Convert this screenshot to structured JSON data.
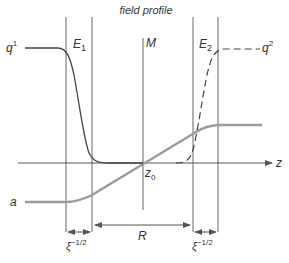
{
  "title": "field profile",
  "labels": {
    "q1": "q",
    "q1_sup": "1",
    "q2": "q",
    "q2_sup": "2",
    "E1": "E",
    "E1_sub": "1",
    "E2": "E",
    "E2_sub": "2",
    "M": "M",
    "z": "z",
    "z0": "z",
    "z0_sub": "0",
    "a": "a",
    "R": "R",
    "xi_left": "ξ",
    "xi_left_sup": "−1/2",
    "xi_right": "ξ",
    "xi_right_sup": "−1/2"
  },
  "colors": {
    "line": "#555555",
    "a_curve": "#9a9a9a",
    "q_curve": "#444444"
  },
  "curves": [
    {
      "name": "q1",
      "style": "solid",
      "description": "flat high on left, drops steeply through E1 wall to zero near z0"
    },
    {
      "name": "q2",
      "style": "dashed",
      "description": "zero left of E2, rises steeply through E2 wall to flat high on right"
    },
    {
      "name": "a",
      "style": "solid-gray-thick",
      "description": "flat low on left, linear rise through z0, flat high on right"
    }
  ]
}
